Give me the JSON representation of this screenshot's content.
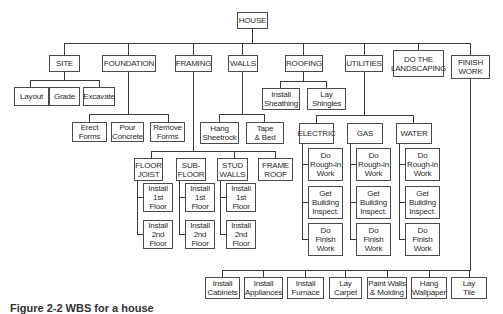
{
  "diagram": {
    "root": "HOUSE",
    "level1": {
      "site": "SITE",
      "foundation": "FOUNDATION",
      "framing": "FRAMING",
      "walls": "WALLS",
      "roofing": "ROOFING",
      "utilities": "UTILITIES",
      "landscaping": "DO THE\nLANDSCAPING",
      "finish": "FINISH\nWORK"
    },
    "site_children": [
      "Layout",
      "Grade",
      "Excavate"
    ],
    "foundation_children": [
      "Erect\nForms",
      "Pour\nConcrete",
      "Remove\nForms"
    ],
    "roofing_children": [
      "Install\nSheathing",
      "Lay\nShingles"
    ],
    "walls_children": [
      "Hang\nSheetrock",
      "Tape\n& Bed"
    ],
    "framing_children": [
      "FLOOR\nJOIST",
      "SUB-\nFLOOR",
      "STUD\nWALLS",
      "FRAME\nROOF"
    ],
    "framing_tasks": [
      "Install\n1st\nFloor",
      "Install\n2nd\nFloor"
    ],
    "utilities_children": [
      "ELECTRIC",
      "GAS",
      "WATER"
    ],
    "utility_tasks": [
      "Do\nRough-in\nWork",
      "Get\nBuilding\nInspect.",
      "Do\nFinish\nWork"
    ],
    "finish_children": [
      "Install\nCabinets",
      "Install\nAppliances",
      "Install\nFurnace",
      "Lay\nCarpet",
      "Paint Walls\n& Molding",
      "Hang\nWallpaper",
      "Lay\nTile"
    ]
  },
  "caption": "Figure 2-2  WBS for a house"
}
